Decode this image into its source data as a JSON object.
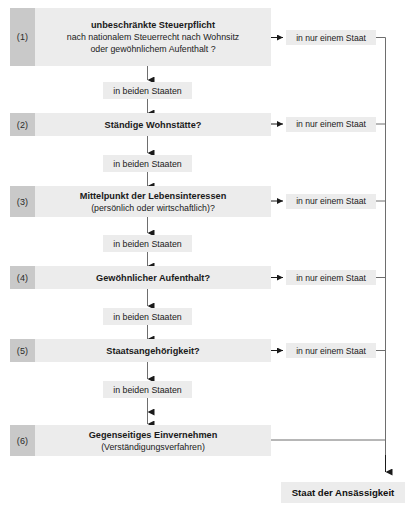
{
  "diagram": {
    "colors": {
      "number_box": "#c9c9c9",
      "content_box": "#ececec",
      "line": "#6e6e6e",
      "text": "#1a1a1a"
    },
    "steps": [
      {
        "number": "(1)",
        "title": "unbeschränkte Steuerpflicht",
        "sub1": "nach nationalem Steuerrecht nach Wohnsitz",
        "sub2": "oder gewöhnlichem Aufenthalt ?",
        "exit_label": "in nur einem Staat",
        "has_exit_arrow": true,
        "down_label": "in beiden Staaten"
      },
      {
        "number": "(2)",
        "title": "Ständige Wohnstätte?",
        "sub1": "",
        "sub2": "",
        "exit_label": "in nur einem Staat",
        "has_exit_arrow": true,
        "down_label": "in beiden Staaten"
      },
      {
        "number": "(3)",
        "title": "Mittelpunkt der Lebensinteressen",
        "sub1": "(persönlich oder wirtschaftlich)?",
        "sub2": "",
        "exit_label": "in nur einem Staat",
        "has_exit_arrow": true,
        "down_label": "in beiden Staaten"
      },
      {
        "number": "(4)",
        "title": "Gewöhnlicher Aufenthalt?",
        "sub1": "",
        "sub2": "",
        "exit_label": "in nur einem Staat",
        "has_exit_arrow": true,
        "down_label": "in beiden Staaten"
      },
      {
        "number": "(5)",
        "title": "Staatsangehörigkeit?",
        "sub1": "",
        "sub2": "",
        "exit_label": "in nur einem Staat",
        "has_exit_arrow": true,
        "down_label": "in beiden Staaten"
      },
      {
        "number": "(6)",
        "title": "Gegenseitiges Einvernehmen",
        "sub1": "(Verständigungsverfahren)",
        "sub2": "",
        "exit_label": "",
        "has_exit_arrow": false,
        "down_label": ""
      }
    ],
    "result": {
      "label": "Staat der Ansässigkeit"
    }
  }
}
